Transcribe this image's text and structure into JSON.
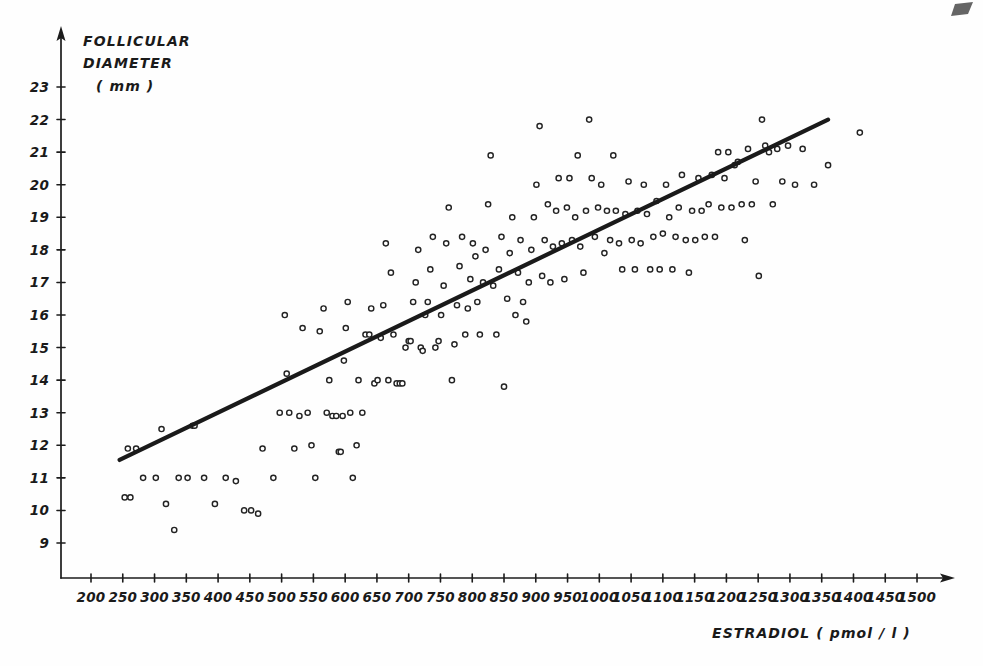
{
  "figure": {
    "background_color": "#fefefe",
    "ink_color": "#1a1a1a",
    "marker_style": "open-circle"
  },
  "axes": {
    "y": {
      "caption_line1": "FOLLICULAR",
      "caption_line2": "DIAMETER",
      "caption_line3": "( mm )",
      "ticks": [
        9,
        10,
        11,
        12,
        13,
        14,
        15,
        16,
        17,
        18,
        19,
        20,
        21,
        22,
        23
      ]
    },
    "x": {
      "caption": "ESTRADIOL   ( pmol / l )",
      "ticks": [
        200,
        250,
        300,
        350,
        400,
        450,
        500,
        550,
        600,
        650,
        700,
        750,
        800,
        850,
        900,
        950,
        1000,
        1050,
        1100,
        1150,
        1200,
        1250,
        1300,
        1350,
        1400,
        1450,
        1500
      ]
    }
  },
  "chart_data": {
    "type": "scatter",
    "title": "",
    "xlabel": "ESTRADIOL   ( pmol / l )",
    "ylabel": "FOLLICULAR DIAMETER ( mm )",
    "xlim": [
      200,
      1500
    ],
    "ylim": [
      9,
      23
    ],
    "grid": false,
    "legend": "none",
    "marker": "open-circle",
    "series": [
      {
        "name": "observations",
        "points": [
          [
            253,
            10.4
          ],
          [
            262,
            10.4
          ],
          [
            258,
            11.9
          ],
          [
            271,
            11.9
          ],
          [
            282,
            11.0
          ],
          [
            302,
            11.0
          ],
          [
            311,
            12.5
          ],
          [
            318,
            10.2
          ],
          [
            331,
            9.4
          ],
          [
            338,
            11.0
          ],
          [
            352,
            11.0
          ],
          [
            360,
            12.6
          ],
          [
            363,
            12.6
          ],
          [
            378,
            11.0
          ],
          [
            395,
            10.2
          ],
          [
            412,
            11.0
          ],
          [
            428,
            10.9
          ],
          [
            441,
            10.0
          ],
          [
            452,
            10.0
          ],
          [
            463,
            9.9
          ],
          [
            470,
            11.9
          ],
          [
            487,
            11.0
          ],
          [
            497,
            13.0
          ],
          [
            505,
            16.0
          ],
          [
            508,
            14.2
          ],
          [
            512,
            13.0
          ],
          [
            520,
            11.9
          ],
          [
            528,
            12.9
          ],
          [
            533,
            15.6
          ],
          [
            541,
            13.0
          ],
          [
            547,
            12.0
          ],
          [
            553,
            11.0
          ],
          [
            560,
            15.5
          ],
          [
            566,
            16.2
          ],
          [
            571,
            13.0
          ],
          [
            575,
            14.0
          ],
          [
            580,
            12.9
          ],
          [
            586,
            12.9
          ],
          [
            590,
            11.8
          ],
          [
            593,
            11.8
          ],
          [
            596,
            12.9
          ],
          [
            598,
            14.6
          ],
          [
            601,
            15.6
          ],
          [
            604,
            16.4
          ],
          [
            608,
            13.0
          ],
          [
            612,
            11.0
          ],
          [
            618,
            12.0
          ],
          [
            621,
            14.0
          ],
          [
            627,
            13.0
          ],
          [
            632,
            15.4
          ],
          [
            638,
            15.4
          ],
          [
            641,
            16.2
          ],
          [
            646,
            13.9
          ],
          [
            651,
            14.0
          ],
          [
            656,
            15.3
          ],
          [
            660,
            16.3
          ],
          [
            664,
            18.2
          ],
          [
            668,
            14.0
          ],
          [
            672,
            17.3
          ],
          [
            676,
            15.4
          ],
          [
            681,
            13.9
          ],
          [
            686,
            13.9
          ],
          [
            690,
            13.9
          ],
          [
            695,
            15.0
          ],
          [
            700,
            15.2
          ],
          [
            703,
            15.2
          ],
          [
            707,
            16.4
          ],
          [
            711,
            17.0
          ],
          [
            715,
            18.0
          ],
          [
            719,
            15.0
          ],
          [
            722,
            14.9
          ],
          [
            726,
            16.0
          ],
          [
            730,
            16.4
          ],
          [
            734,
            17.4
          ],
          [
            738,
            18.4
          ],
          [
            742,
            15.0
          ],
          [
            747,
            15.2
          ],
          [
            751,
            16.0
          ],
          [
            755,
            16.9
          ],
          [
            759,
            18.2
          ],
          [
            763,
            19.3
          ],
          [
            768,
            14.0
          ],
          [
            772,
            15.1
          ],
          [
            776,
            16.3
          ],
          [
            780,
            17.5
          ],
          [
            784,
            18.4
          ],
          [
            789,
            15.4
          ],
          [
            793,
            16.2
          ],
          [
            797,
            17.1
          ],
          [
            801,
            18.2
          ],
          [
            805,
            17.8
          ],
          [
            808,
            16.4
          ],
          [
            812,
            15.4
          ],
          [
            817,
            17.0
          ],
          [
            821,
            18.0
          ],
          [
            825,
            19.4
          ],
          [
            829,
            20.9
          ],
          [
            833,
            16.9
          ],
          [
            838,
            15.4
          ],
          [
            842,
            17.4
          ],
          [
            846,
            18.4
          ],
          [
            850,
            13.8
          ],
          [
            855,
            16.5
          ],
          [
            859,
            17.9
          ],
          [
            863,
            19.0
          ],
          [
            868,
            16.0
          ],
          [
            872,
            17.3
          ],
          [
            876,
            18.3
          ],
          [
            880,
            16.4
          ],
          [
            885,
            15.8
          ],
          [
            889,
            17.0
          ],
          [
            893,
            18.0
          ],
          [
            897,
            19.0
          ],
          [
            901,
            20.0
          ],
          [
            906,
            21.8
          ],
          [
            910,
            17.2
          ],
          [
            914,
            18.3
          ],
          [
            919,
            19.4
          ],
          [
            923,
            17.0
          ],
          [
            927,
            18.1
          ],
          [
            932,
            19.2
          ],
          [
            936,
            20.2
          ],
          [
            941,
            18.2
          ],
          [
            945,
            17.1
          ],
          [
            949,
            19.3
          ],
          [
            953,
            20.2
          ],
          [
            957,
            18.3
          ],
          [
            962,
            19.0
          ],
          [
            966,
            20.9
          ],
          [
            970,
            18.1
          ],
          [
            975,
            17.3
          ],
          [
            979,
            19.2
          ],
          [
            984,
            22.0
          ],
          [
            988,
            20.2
          ],
          [
            993,
            18.4
          ],
          [
            998,
            19.3
          ],
          [
            1003,
            20.0
          ],
          [
            1008,
            17.9
          ],
          [
            1012,
            19.2
          ],
          [
            1017,
            18.3
          ],
          [
            1022,
            20.9
          ],
          [
            1026,
            19.2
          ],
          [
            1031,
            18.2
          ],
          [
            1036,
            17.4
          ],
          [
            1041,
            19.1
          ],
          [
            1046,
            20.1
          ],
          [
            1051,
            18.3
          ],
          [
            1056,
            17.4
          ],
          [
            1060,
            19.2
          ],
          [
            1065,
            18.2
          ],
          [
            1070,
            20.0
          ],
          [
            1075,
            19.1
          ],
          [
            1080,
            17.4
          ],
          [
            1085,
            18.4
          ],
          [
            1090,
            19.5
          ],
          [
            1095,
            17.4
          ],
          [
            1100,
            18.5
          ],
          [
            1105,
            20.0
          ],
          [
            1110,
            19.0
          ],
          [
            1115,
            17.4
          ],
          [
            1120,
            18.4
          ],
          [
            1125,
            19.3
          ],
          [
            1130,
            20.3
          ],
          [
            1136,
            18.3
          ],
          [
            1141,
            17.3
          ],
          [
            1146,
            19.2
          ],
          [
            1151,
            18.3
          ],
          [
            1156,
            20.2
          ],
          [
            1161,
            19.2
          ],
          [
            1166,
            18.4
          ],
          [
            1172,
            19.4
          ],
          [
            1177,
            20.3
          ],
          [
            1182,
            18.4
          ],
          [
            1187,
            21.0
          ],
          [
            1192,
            19.3
          ],
          [
            1197,
            20.2
          ],
          [
            1203,
            21.0
          ],
          [
            1208,
            19.3
          ],
          [
            1213,
            20.6
          ],
          [
            1218,
            20.7
          ],
          [
            1224,
            19.4
          ],
          [
            1229,
            18.3
          ],
          [
            1234,
            21.1
          ],
          [
            1240,
            19.4
          ],
          [
            1246,
            20.1
          ],
          [
            1251,
            17.2
          ],
          [
            1256,
            22.0
          ],
          [
            1261,
            21.2
          ],
          [
            1267,
            21.0
          ],
          [
            1273,
            19.4
          ],
          [
            1280,
            21.1
          ],
          [
            1288,
            20.1
          ],
          [
            1297,
            21.2
          ],
          [
            1308,
            20.0
          ],
          [
            1320,
            21.1
          ],
          [
            1338,
            20.0
          ],
          [
            1360,
            20.6
          ],
          [
            1410,
            21.6
          ]
        ]
      }
    ],
    "regression_line": {
      "x_start": 245,
      "y_start": 11.55,
      "x_end": 1360,
      "y_end": 22.0
    }
  }
}
